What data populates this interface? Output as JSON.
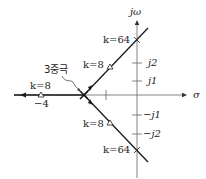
{
  "diagram": {
    "type": "root-locus",
    "axes": {
      "vertical_label": "jω",
      "horizontal_label": "σ"
    },
    "imag_ticks": [
      "j2",
      "j1",
      "−j1",
      "−j2"
    ],
    "real_ticks": [
      "−4"
    ],
    "annotations": {
      "triple_pole": "3중극",
      "k8_upper": "k=8",
      "k8_lower": "k=8",
      "k8_real": "k=8",
      "k64_upper": "k=64",
      "k64_lower": "k=64"
    },
    "colors": {
      "line": "#1a1a1a",
      "axis": "#555555",
      "text": "#222222"
    }
  }
}
